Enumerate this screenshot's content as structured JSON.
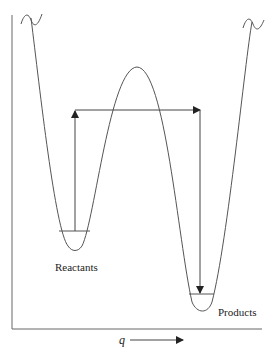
{
  "diagram": {
    "type": "potential-energy-surface",
    "labels": {
      "reactants": "Reactants",
      "products": "Products",
      "x_axis_symbol": "q"
    },
    "colors": {
      "curve": "#555555",
      "axis": "#555555",
      "arrow": "#222222",
      "background": "#ffffff"
    },
    "wells": [
      {
        "name": "Reactants",
        "min_x": 75,
        "min_y": 250,
        "level_y": 231
      },
      {
        "name": "Products",
        "min_x": 203,
        "min_y": 312,
        "level_y": 294
      }
    ],
    "barrier": {
      "peak_x": 137,
      "peak_y": 67
    },
    "transition_path": {
      "up_arrow": {
        "x": 75,
        "from_y": 231,
        "to_y": 110
      },
      "horizontal": {
        "y": 110,
        "from_x": 75,
        "to_x": 200
      },
      "down_arrow": {
        "x": 200,
        "from_y": 110,
        "to_y": 294
      }
    }
  }
}
